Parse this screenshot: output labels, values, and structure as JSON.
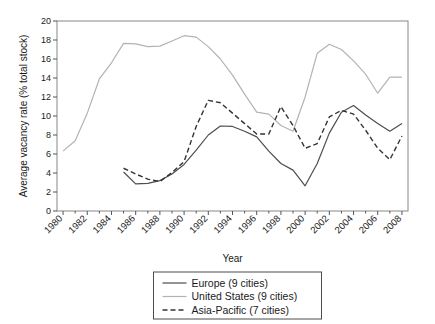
{
  "chart_data": {
    "type": "line",
    "title": "",
    "xlabel": "Year",
    "ylabel": "Average vacancy rate (% total stock)",
    "xlim": [
      1979.5,
      2008.5
    ],
    "ylim": [
      0,
      20
    ],
    "ytick_step": 2,
    "yticks": [
      "0",
      "2",
      "4",
      "6",
      "8",
      "10",
      "12",
      "14",
      "16",
      "18",
      "20"
    ],
    "xticks": [
      "1980",
      "1982",
      "1984",
      "1986",
      "1988",
      "1990",
      "1992",
      "1994",
      "1996",
      "1998",
      "2000",
      "2002",
      "2004",
      "2006",
      "2008"
    ],
    "xtick_rotation": 45,
    "grid": false,
    "legend_position": "below-center",
    "series": [
      {
        "name": "Europe (9 cities)",
        "legend_label": "Europe (9 cities)",
        "color": "#4d4d4d",
        "style": "solid",
        "width": 1.2,
        "x": [
          1985,
          1986,
          1987,
          1988,
          1989,
          1990,
          1991,
          1992,
          1993,
          1994,
          1995,
          1996,
          1997,
          1998,
          1999,
          2000,
          2001,
          2002,
          2003,
          2004,
          2005,
          2006,
          2007,
          2008
        ],
        "values": [
          4.1,
          2.85,
          2.9,
          3.2,
          3.9,
          4.9,
          6.4,
          8.0,
          8.95,
          8.9,
          8.4,
          7.8,
          6.3,
          5.0,
          4.3,
          2.65,
          5.0,
          8.2,
          10.4,
          11.1,
          10.1,
          9.2,
          8.4,
          9.2
        ]
      },
      {
        "name": "United States (9 cities)",
        "legend_label": "United States (9 cities)",
        "color": "#b3b3b3",
        "style": "solid",
        "width": 1.2,
        "x": [
          1980,
          1981,
          1982,
          1983,
          1984,
          1985,
          1986,
          1987,
          1988,
          1989,
          1990,
          1991,
          1992,
          1993,
          1994,
          1995,
          1996,
          1997,
          1998,
          1999,
          2000,
          2001,
          2002,
          2003,
          2004,
          2005,
          2006,
          2007,
          2008
        ],
        "values": [
          6.3,
          7.4,
          10.3,
          13.9,
          15.6,
          17.65,
          17.6,
          17.3,
          17.35,
          17.9,
          18.45,
          18.3,
          17.3,
          16.0,
          14.3,
          12.3,
          10.4,
          10.2,
          9.0,
          8.4,
          12.0,
          16.6,
          17.55,
          17.0,
          15.8,
          14.4,
          12.4,
          14.1,
          14.1
        ]
      },
      {
        "name": "Asia-Pacific (7 cities)",
        "legend_label": "Asia-Pacific (7 cities)",
        "color": "#333333",
        "style": "dashed",
        "width": 1.4,
        "x": [
          1985,
          1986,
          1987,
          1988,
          1989,
          1990,
          1991,
          1992,
          1993,
          1994,
          1995,
          1996,
          1997,
          1998,
          1999,
          2000,
          2001,
          2002,
          2003,
          2004,
          2005,
          2006,
          2007,
          2008
        ],
        "values": [
          4.5,
          3.9,
          3.35,
          3.1,
          4.05,
          5.2,
          8.9,
          11.65,
          11.4,
          10.3,
          9.2,
          8.1,
          8.1,
          11.0,
          9.0,
          6.6,
          7.1,
          9.9,
          10.6,
          10.2,
          8.5,
          6.6,
          5.4,
          7.9
        ]
      }
    ]
  },
  "legend": {
    "items": [
      {
        "label": "Europe (9 cities)"
      },
      {
        "label": "United States (9 cities)"
      },
      {
        "label": "Asia-Pacific (7 cities)"
      }
    ]
  },
  "axes": {
    "x_title": "Year",
    "y_title": "Average vacancy rate (% total stock)"
  }
}
